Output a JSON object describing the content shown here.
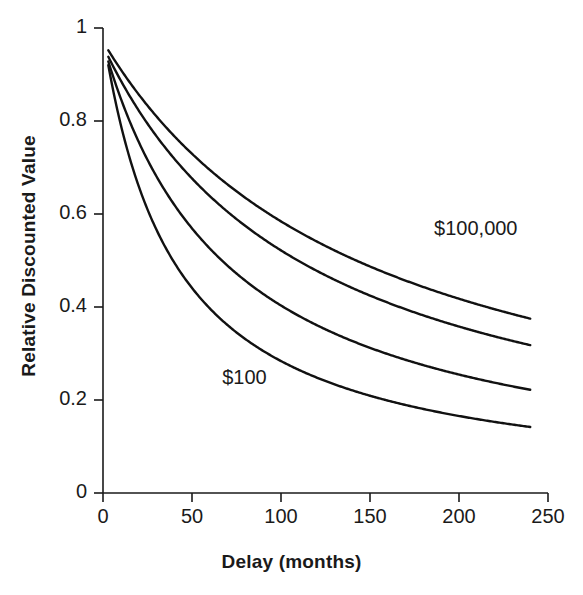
{
  "chart_data": {
    "type": "line",
    "title": "",
    "xlabel": "Delay (months)",
    "ylabel": "Relative Discounted Value",
    "xlim": [
      0,
      250
    ],
    "ylim": [
      0,
      1
    ],
    "grid": false,
    "legend_position": "inline-annotations",
    "xticks": [
      0,
      50,
      100,
      150,
      200,
      250
    ],
    "xtick_labels": [
      "0",
      "50",
      "100",
      "150",
      "200",
      "250"
    ],
    "yticks": [
      0,
      0.2,
      0.4,
      0.6,
      0.8,
      1
    ],
    "ytick_labels": [
      "0",
      "0.2",
      "0.4",
      "0.6",
      "0.8",
      "1"
    ],
    "annotations": [
      {
        "text": "$100,000",
        "x": 186,
        "y": 0.565
      },
      {
        "text": "$100",
        "x": 67,
        "y": 0.245
      }
    ],
    "x": [
      3,
      6,
      12,
      24,
      36,
      48,
      60,
      84,
      108,
      132,
      156,
      180,
      204,
      228,
      240
    ],
    "series": [
      {
        "name": "$100,000",
        "values": [
          0.952,
          0.925,
          0.888,
          0.838,
          0.802,
          0.772,
          0.747,
          0.704,
          0.668,
          0.636,
          0.605,
          0.576,
          0.548,
          0.52,
          0.505
        ]
      },
      {
        "name": "$25,000",
        "values": [
          0.938,
          0.908,
          0.865,
          0.806,
          0.763,
          0.729,
          0.7,
          0.652,
          0.612,
          0.577,
          0.545,
          0.515,
          0.487,
          0.46,
          0.446
        ]
      },
      {
        "name": "$1,000",
        "values": [
          0.928,
          0.89,
          0.836,
          0.764,
          0.712,
          0.671,
          0.637,
          0.582,
          0.537,
          0.499,
          0.465,
          0.434,
          0.406,
          0.38,
          0.367
        ]
      },
      {
        "name": "$100",
        "values": [
          0.92,
          0.872,
          0.804,
          0.714,
          0.651,
          0.603,
          0.563,
          0.501,
          0.452,
          0.413,
          0.379,
          0.35,
          0.324,
          0.3,
          0.289
        ]
      }
    ],
    "series_endpoints_at_240_months": [
      0.375,
      0.318,
      0.222,
      0.142
    ],
    "line_color": "#111111",
    "line_width": 2.4
  }
}
